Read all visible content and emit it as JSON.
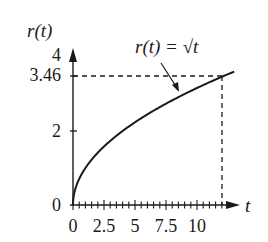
{
  "chart_data": {
    "type": "line",
    "title": "",
    "xlabel": "t",
    "ylabel": "r(t)",
    "xlim": [
      0,
      13
    ],
    "ylim": [
      0,
      4
    ],
    "x_ticks": [
      0,
      2.5,
      5,
      7.5,
      10
    ],
    "x_tick_labels": [
      "0",
      "2.5",
      "5",
      "7.5",
      "10"
    ],
    "x_minor_tick_step": 0.5,
    "y_ticks": [
      0,
      2,
      3.46,
      4
    ],
    "y_tick_labels": [
      "0",
      "2",
      "3.46",
      "4"
    ],
    "grid": false,
    "legend": null,
    "series": [
      {
        "name": "r(t) = √t",
        "x": [
          0,
          0.25,
          0.5,
          1,
          2,
          3,
          4,
          5,
          6,
          7,
          8,
          9,
          10,
          11,
          12,
          13
        ],
        "values": [
          0,
          0.5,
          0.707,
          1,
          1.414,
          1.732,
          2,
          2.236,
          2.449,
          2.646,
          2.828,
          3,
          3.162,
          3.317,
          3.464,
          3.606
        ]
      }
    ],
    "annotations": [
      {
        "text": "r(t) = √t",
        "type": "arrow-label",
        "points_to": {
          "x": 8.5,
          "y": 2.92
        }
      },
      {
        "type": "dashed-guide",
        "from": {
          "x": 0,
          "y": 3.46
        },
        "to": {
          "x": 12,
          "y": 3.46
        }
      },
      {
        "type": "dashed-guide",
        "from": {
          "x": 12,
          "y": 0
        },
        "to": {
          "x": 12,
          "y": 3.46
        }
      }
    ]
  },
  "labels": {
    "y_axis": "r(t)",
    "x_axis": "t",
    "curve": "r(t) = √t",
    "y_ticks": [
      "4",
      "3.46",
      "2",
      "0"
    ],
    "x_ticks": [
      "0",
      "2.5",
      "5",
      "7.5",
      "10"
    ]
  },
  "colors": {
    "ink": "#1a1a1a",
    "background": "#ffffff"
  }
}
